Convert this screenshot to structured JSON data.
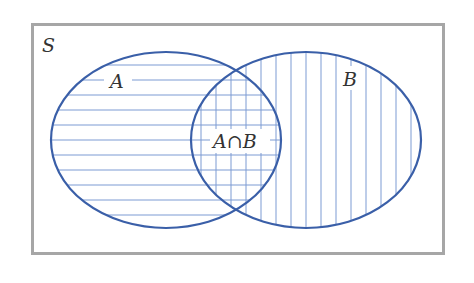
{
  "diagram": {
    "type": "venn",
    "universe_label": "S",
    "sets": [
      {
        "id": "A",
        "label": "A",
        "hatch": "horizontal"
      },
      {
        "id": "B",
        "label": "B",
        "hatch": "vertical"
      }
    ],
    "intersection_label": "A∩B",
    "colors": {
      "outline": "#3a5fa8",
      "hatch": "#7d9bd3",
      "frame": "#a6a6a6",
      "text": "#333333"
    }
  }
}
